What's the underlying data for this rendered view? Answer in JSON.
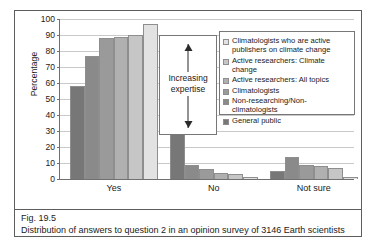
{
  "figure": {
    "number": "Fig. 19.5",
    "caption": "Distribution of answers to question 2 in an opinion survey of 3146 Earth scientists"
  },
  "annotation": {
    "label": "Increasing\nexpertise",
    "arrow_icon": "double-headed-vertical-arrow-icon"
  },
  "chart_data": {
    "type": "bar",
    "title": "",
    "xlabel": "",
    "ylabel": "Percentage",
    "ylim": [
      0,
      100
    ],
    "yticks": [
      0,
      10,
      20,
      30,
      40,
      50,
      60,
      70,
      80,
      90,
      100
    ],
    "grid": true,
    "legend_position": "inside-top-right",
    "categories": [
      "Yes",
      "No",
      "Not sure"
    ],
    "series": [
      {
        "name": "Climatologists who are active\npublishers on climate change",
        "color": "#e2e2e2",
        "values": [
          97,
          1.5,
          1.5
        ]
      },
      {
        "name": "Active researchers: Climate change",
        "color": "#c6c6c6",
        "values": [
          90,
          3,
          7
        ]
      },
      {
        "name": "Active researchers: All topics",
        "color": "#b0b0b0",
        "values": [
          88.5,
          4,
          8
        ]
      },
      {
        "name": "Climatologists",
        "color": "#9a9a9a",
        "values": [
          88,
          6,
          8.5
        ]
      },
      {
        "name": "Non-researching/Non-climatologists",
        "color": "#8a8a8a",
        "values": [
          77,
          9,
          14
        ]
      },
      {
        "name": "General public",
        "color": "#777777",
        "values": [
          58,
          38,
          5
        ]
      }
    ]
  }
}
